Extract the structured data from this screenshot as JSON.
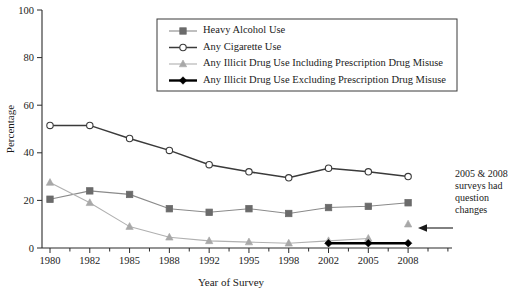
{
  "chart_data": {
    "type": "line",
    "title": "",
    "xlabel": "Year of Survey",
    "ylabel": "Percentage",
    "ylim": [
      0,
      100
    ],
    "yticks": [
      0,
      20,
      40,
      60,
      80,
      100
    ],
    "ytick_labels": [
      "0",
      "20",
      "40",
      "60",
      "80",
      "100"
    ],
    "categories": [
      "1980",
      "1982",
      "1985",
      "1988",
      "1992",
      "1995",
      "1998",
      "2002",
      "2005",
      "2008"
    ],
    "grid": false,
    "legend_position": "top-center",
    "series": [
      {
        "name": "Heavy Alcohol Use",
        "marker": "square",
        "color": "#6b6b6b",
        "line_color": "#8a8a8a",
        "values": [
          20.5,
          24.0,
          22.5,
          16.5,
          15.0,
          16.5,
          14.5,
          17.0,
          17.5,
          19.0
        ]
      },
      {
        "name": "Any Cigarette Use",
        "marker": "circle",
        "color": "#ffffff",
        "line_color": "#3a3a3a",
        "values": [
          51.5,
          51.5,
          46.0,
          41.0,
          35.0,
          32.0,
          29.5,
          33.5,
          32.0,
          30.0
        ]
      },
      {
        "name": "Any Illicit Drug Use Including Prescription Drug Misuse",
        "marker": "triangle",
        "color": "#a8a8a8",
        "line_color": "#b0b0b0",
        "values": [
          27.5,
          19.0,
          9.0,
          4.5,
          3.0,
          2.5,
          2.0,
          3.0,
          4.0,
          10.0
        ]
      },
      {
        "name": "Any Illicit Drug Use Excluding Prescription Drug Misuse",
        "marker": "diamond",
        "color": "#000000",
        "line_color": "#000000",
        "values": [
          null,
          null,
          null,
          null,
          null,
          null,
          null,
          2.0,
          2.0,
          2.0
        ]
      }
    ],
    "annotation": {
      "lines": [
        "2005 & 2008",
        "surveys had",
        "question",
        "changes"
      ],
      "arrow": "left-arrow"
    }
  },
  "legend": {
    "items": [
      {
        "label": "Heavy Alcohol Use",
        "marker": "square-marker"
      },
      {
        "label": "Any Cigarette Use",
        "marker": "circle-marker"
      },
      {
        "label": "Any Illicit Drug Use Including Prescription Drug Misuse",
        "marker": "triangle-marker"
      },
      {
        "label": "Any Illicit Drug Use Excluding Prescription Drug Misuse",
        "marker": "diamond-marker"
      }
    ]
  },
  "colors": {
    "axis": "#2b2b2b",
    "alcohol": "#6b6b6b",
    "cigarette": "#3a3a3a",
    "illicit_including": "#a8a8a8",
    "illicit_excluding": "#000000",
    "background": "#ffffff"
  }
}
